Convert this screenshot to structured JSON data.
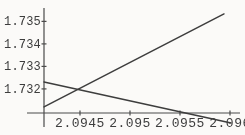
{
  "figure": {
    "background": "#fbfaf8",
    "ink": "#3d3d3d",
    "axis_color": "#4a4a4a"
  },
  "chart_data": {
    "type": "line",
    "title": "",
    "xlabel": "",
    "ylabel": "",
    "grid": false,
    "legend": false,
    "xlim": [
      2.09414,
      2.09614
    ],
    "ylim": [
      1.73093,
      1.73595
    ],
    "axes_origin": [
      2.09414,
      1.73093
    ],
    "x_ticks": [
      {
        "value": 2.0945,
        "label": "2.0945"
      },
      {
        "value": 2.095,
        "label": "2.095"
      },
      {
        "value": 2.0955,
        "label": "2.0955"
      },
      {
        "value": 2.096,
        "label": "2.096"
      }
    ],
    "y_ticks": [
      {
        "value": 1.732,
        "label": "1.732"
      },
      {
        "value": 1.733,
        "label": "1.733"
      },
      {
        "value": 1.734,
        "label": "1.734"
      },
      {
        "value": 1.735,
        "label": "1.735"
      }
    ],
    "series": [
      {
        "name": "rising-line",
        "points": [
          [
            2.09414,
            1.7312
          ],
          [
            2.09594,
            1.73533
          ]
        ]
      },
      {
        "name": "falling-line",
        "points": [
          [
            2.09414,
            1.73231
          ],
          [
            2.09601,
            1.73049
          ]
        ]
      }
    ],
    "intersection_approx": [
      2.0945,
      1.732
    ]
  }
}
